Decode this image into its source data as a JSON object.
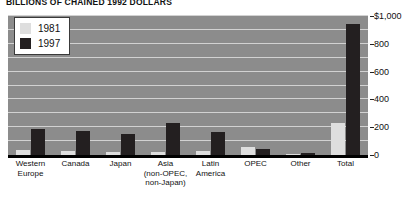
{
  "chart_data": {
    "type": "bar",
    "title": "BILLIONS OF CHAINED 1992 DOLLARS",
    "xlabel": "",
    "ylabel": "",
    "ylim": [
      0,
      1000
    ],
    "grid": true,
    "legend_position": "top-left",
    "categories": [
      "Western Europe",
      "Canada",
      "Japan",
      "Asia (non-OPEC, non-Japan)",
      "Latin America",
      "OPEC",
      "Other",
      "Total"
    ],
    "category_lines": [
      [
        "Western",
        "Europe"
      ],
      [
        "Canada"
      ],
      [
        "Japan"
      ],
      [
        "Asia",
        "(non-OPEC,",
        "non-Japan)"
      ],
      [
        "Latin",
        "America"
      ],
      [
        "OPEC"
      ],
      [
        "Other"
      ],
      [
        "Total"
      ]
    ],
    "series": [
      {
        "name": "1981",
        "color": "#dedede",
        "values": [
          35,
          30,
          25,
          25,
          30,
          55,
          5,
          230
        ]
      },
      {
        "name": "1997",
        "color": "#231f20",
        "values": [
          190,
          175,
          150,
          230,
          165,
          45,
          15,
          945
        ]
      }
    ],
    "y_ticks": [
      {
        "value": 1000,
        "label": "$1,000"
      },
      {
        "value": 800,
        "label": "800"
      },
      {
        "value": 600,
        "label": "600"
      },
      {
        "value": 400,
        "label": "400"
      },
      {
        "value": 200,
        "label": "200"
      },
      {
        "value": 0,
        "label": "0"
      }
    ],
    "gridline_values": [
      100,
      200,
      300,
      400,
      500,
      600,
      700,
      800,
      900,
      1000
    ],
    "plot_background": "#8c8c8c",
    "gridline_color": "#d2d2d2"
  },
  "legend": {
    "items": [
      {
        "label": "1981",
        "color": "#dedede"
      },
      {
        "label": "1997",
        "color": "#231f20"
      }
    ]
  }
}
